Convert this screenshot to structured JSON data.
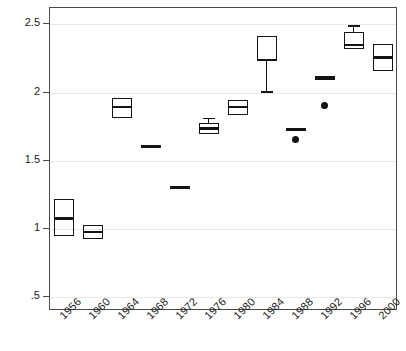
{
  "chart_data": {
    "type": "box",
    "title": "",
    "xlabel": "",
    "ylabel": "Stratification",
    "ylim": [
      0.4,
      2.62
    ],
    "yticks": [
      0.5,
      1,
      1.5,
      2,
      2.5
    ],
    "ytick_labels": [
      ".5",
      "1",
      "1.5",
      "2",
      "2.5"
    ],
    "grid": "horizontal",
    "legend": "none",
    "categories": [
      "1956",
      "1960",
      "1964",
      "1968",
      "1972",
      "1976",
      "1980",
      "1984",
      "1988",
      "1992",
      "1996",
      "2000"
    ],
    "boxes": [
      {
        "category": "1956",
        "whisker_low": null,
        "q1": 0.94,
        "median": 1.07,
        "q3": 1.21,
        "whisker_high": null,
        "outliers": []
      },
      {
        "category": "1960",
        "whisker_low": null,
        "q1": 0.92,
        "median": 0.97,
        "q3": 1.02,
        "whisker_high": null,
        "outliers": []
      },
      {
        "category": "1964",
        "whisker_low": null,
        "q1": 1.81,
        "median": 1.89,
        "q3": 1.95,
        "whisker_high": null,
        "outliers": []
      },
      {
        "category": "1968",
        "whisker_low": null,
        "q1": 1.6,
        "median": 1.6,
        "q3": 1.6,
        "whisker_high": null,
        "outliers": []
      },
      {
        "category": "1972",
        "whisker_low": null,
        "q1": 1.3,
        "median": 1.3,
        "q3": 1.3,
        "whisker_high": null,
        "outliers": []
      },
      {
        "category": "1976",
        "whisker_low": null,
        "q1": 1.69,
        "median": 1.73,
        "q3": 1.77,
        "whisker_high": 1.81,
        "outliers": []
      },
      {
        "category": "1980",
        "whisker_low": null,
        "q1": 1.83,
        "median": 1.89,
        "q3": 1.94,
        "whisker_high": null,
        "outliers": []
      },
      {
        "category": "1984",
        "whisker_low": 1.99,
        "q1": 2.23,
        "median": 2.23,
        "q3": 2.41,
        "whisker_high": null,
        "outliers": []
      },
      {
        "category": "1988",
        "whisker_low": null,
        "q1": 1.71,
        "median": 1.72,
        "q3": 1.73,
        "whisker_high": null,
        "outliers": [
          1.65
        ]
      },
      {
        "category": "1992",
        "whisker_low": null,
        "q1": 2.1,
        "median": 2.1,
        "q3": 2.1,
        "whisker_high": null,
        "outliers": [
          1.9
        ]
      },
      {
        "category": "1996",
        "whisker_low": null,
        "q1": 2.31,
        "median": 2.34,
        "q3": 2.44,
        "whisker_high": 2.49,
        "outliers": []
      },
      {
        "category": "2000",
        "whisker_low": null,
        "q1": 2.15,
        "median": 2.25,
        "q3": 2.35,
        "whisker_high": null,
        "outliers": []
      }
    ],
    "colors": {
      "box_stroke": "#141414",
      "median": "#141414",
      "grid": "#e8e8e8",
      "frame": "#4a4a4a",
      "background": "#ffffff"
    }
  }
}
